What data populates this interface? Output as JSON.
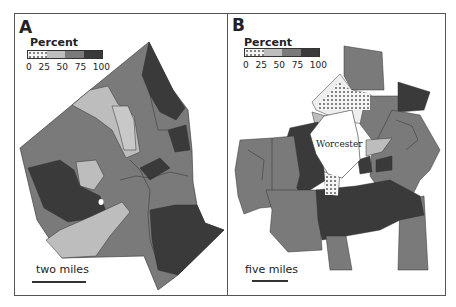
{
  "panels": [
    {
      "letter": "A",
      "legend": {
        "title": "Percent",
        "ticks": [
          "0",
          "25",
          "50",
          "75",
          "100"
        ],
        "classes": [
          {
            "range": "0-25",
            "color": "#f2f2f2",
            "pattern": "dots"
          },
          {
            "range": "25-50",
            "color": "#bdbdbd"
          },
          {
            "range": "50-75",
            "color": "#7a7a7a"
          },
          {
            "range": "75-100",
            "color": "#3a3a3a"
          }
        ]
      },
      "scale": {
        "label": "two miles"
      }
    },
    {
      "letter": "B",
      "legend": {
        "title": "Percent",
        "ticks": [
          "0",
          "25",
          "50",
          "75",
          "100"
        ],
        "classes": [
          {
            "range": "0-25",
            "color": "#f2f2f2",
            "pattern": "dots"
          },
          {
            "range": "25-50",
            "color": "#bdbdbd"
          },
          {
            "range": "50-75",
            "color": "#7a7a7a"
          },
          {
            "range": "75-100",
            "color": "#3a3a3a"
          }
        ]
      },
      "scale": {
        "label": "five miles"
      },
      "place_label": "Worcester"
    }
  ],
  "colors": {
    "c0": "#f2f2f2",
    "c1": "#bdbdbd",
    "c2": "#7a7a7a",
    "c3": "#3a3a3a",
    "frame": "#555555",
    "text": "#222222"
  }
}
